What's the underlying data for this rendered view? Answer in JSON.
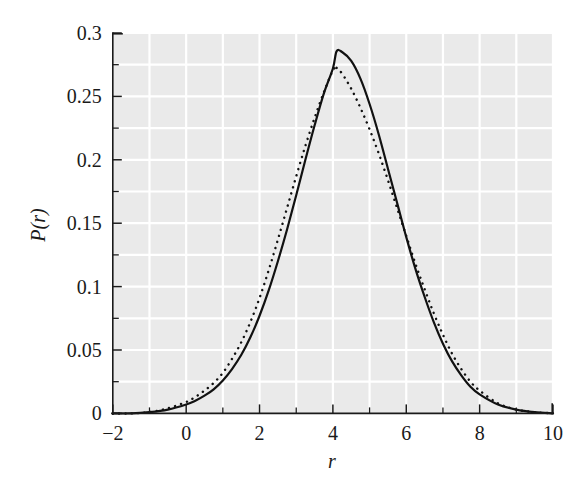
{
  "figure": {
    "background_color": "#ffffff",
    "plot_background_color": "#eaeaea",
    "gridline_color": "#ffffff",
    "curve_color": "#111111"
  },
  "axes": {
    "x_title": "r",
    "y_title": "P(r)",
    "x_tick_labels": [
      "−2",
      "0",
      "2",
      "4",
      "6",
      "8",
      "10"
    ],
    "y_tick_labels": [
      "0",
      "0.05",
      "0.1",
      "0.15",
      "0.2",
      "0.25",
      "0.3"
    ]
  },
  "chart_data": {
    "type": "line",
    "title": "",
    "xlabel": "r",
    "ylabel": "P(r)",
    "xlim": [
      -2,
      10
    ],
    "ylim": [
      0,
      0.3
    ],
    "xticks": [
      -2,
      0,
      2,
      4,
      6,
      8,
      10
    ],
    "xticks_minor": [
      -1,
      1,
      3,
      5,
      7,
      9
    ],
    "yticks": [
      0,
      0.05,
      0.1,
      0.15,
      0.2,
      0.25,
      0.3
    ],
    "yticks_minor": [
      0.025,
      0.075,
      0.125,
      0.175,
      0.225,
      0.275
    ],
    "grid": true,
    "grid_color": "#ffffff",
    "legend": null,
    "x": [
      -2,
      -1.5,
      -1,
      -0.5,
      0,
      0.25,
      0.5,
      0.75,
      1,
      1.25,
      1.5,
      1.75,
      2,
      2.25,
      2.5,
      2.75,
      3,
      3.25,
      3.5,
      3.75,
      4,
      4.1,
      4.25,
      4.5,
      4.75,
      5,
      5.25,
      5.5,
      5.75,
      6,
      6.25,
      6.5,
      6.75,
      7,
      7.25,
      7.5,
      7.75,
      8,
      8.5,
      9,
      9.5,
      10
    ],
    "series": [
      {
        "name": "solid-curve",
        "style": "solid",
        "values": [
          0.0,
          0.0,
          0.001,
          0.003,
          0.007,
          0.01,
          0.014,
          0.019,
          0.026,
          0.035,
          0.046,
          0.06,
          0.077,
          0.097,
          0.12,
          0.145,
          0.172,
          0.2,
          0.227,
          0.252,
          0.272,
          0.2855,
          0.285,
          0.278,
          0.264,
          0.244,
          0.22,
          0.193,
          0.166,
          0.139,
          0.114,
          0.092,
          0.072,
          0.055,
          0.041,
          0.03,
          0.021,
          0.015,
          0.007,
          0.003,
          0.001,
          0.0
        ]
      },
      {
        "name": "dotted-curve",
        "style": "dotted",
        "values": [
          0.0,
          0.0,
          0.001,
          0.004,
          0.009,
          0.013,
          0.018,
          0.024,
          0.032,
          0.043,
          0.056,
          0.072,
          0.091,
          0.113,
          0.137,
          0.162,
          0.187,
          0.211,
          0.233,
          0.253,
          0.2705,
          0.2725,
          0.268,
          0.256,
          0.241,
          0.224,
          0.205,
          0.184,
          0.162,
          0.14,
          0.118,
          0.098,
          0.079,
          0.062,
          0.047,
          0.035,
          0.025,
          0.018,
          0.008,
          0.003,
          0.001,
          0.0
        ]
      }
    ]
  }
}
